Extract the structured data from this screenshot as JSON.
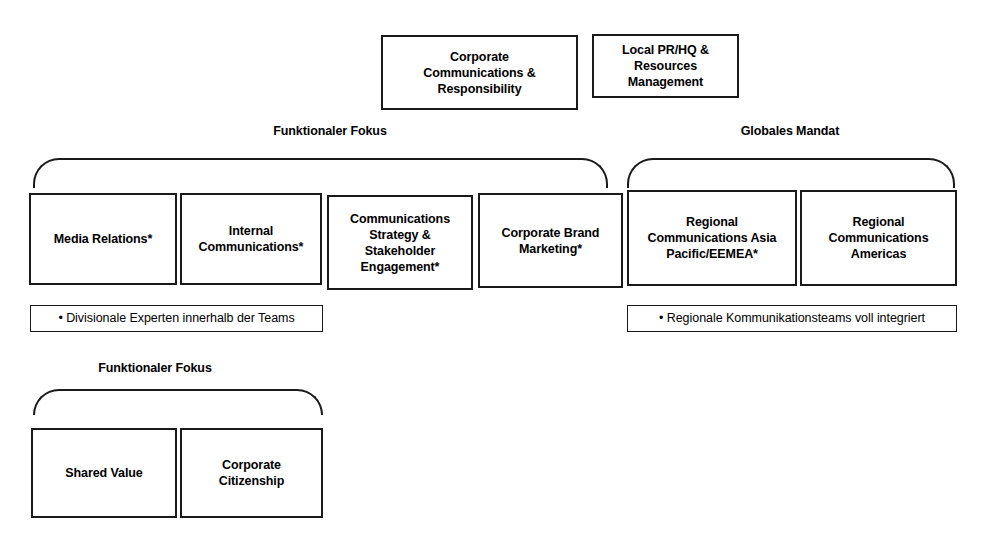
{
  "diagram": {
    "title_boxes": [
      {
        "id": "corporate-communications-responsibility",
        "label": "Corporate\nCommunications &\nResponsibility"
      },
      {
        "id": "local-pr-hq-resources-management",
        "label": "Local PR/HQ &\nResources\nManagement"
      }
    ],
    "groups": [
      {
        "id": "funktionaler-fokus-top",
        "caption": "Funktionaler Fokus"
      },
      {
        "id": "globales-mandat",
        "caption": "Globales Mandat"
      },
      {
        "id": "funktionaler-fokus-bottom",
        "caption": "Funktionaler Fokus"
      }
    ],
    "functional_units": [
      {
        "id": "media-relations",
        "label": "Media Relations*"
      },
      {
        "id": "internal-communications",
        "label": "Internal\nCommunications*"
      },
      {
        "id": "communications-strategy-stakeholder-engagement",
        "label": "Communications\nStrategy &\nStakeholder\nEngagement*"
      },
      {
        "id": "corporate-brand-marketing",
        "label": "Corporate Brand\nMarketing*"
      }
    ],
    "regional_units": [
      {
        "id": "regional-communications-asia-pacific-eemea",
        "label": "Regional\nCommunications Asia\nPacific/EEMEA*"
      },
      {
        "id": "regional-communications-americas",
        "label": "Regional\nCommunications\nAmericas"
      }
    ],
    "notes": [
      {
        "id": "note-divisionale-experten",
        "label": "• Divisionale Experten innerhalb der Teams"
      },
      {
        "id": "note-regionale-kommunikationsteams",
        "label": "• Regionale Kommunikationsteams voll integriert"
      }
    ],
    "bottom_units": [
      {
        "id": "shared-value",
        "label": "Shared Value"
      },
      {
        "id": "corporate-citizenship",
        "label": "Corporate\nCitizenship"
      }
    ],
    "colors": {
      "stroke": "#1a1a1a",
      "text": "#000000",
      "background": "#ffffff"
    }
  }
}
